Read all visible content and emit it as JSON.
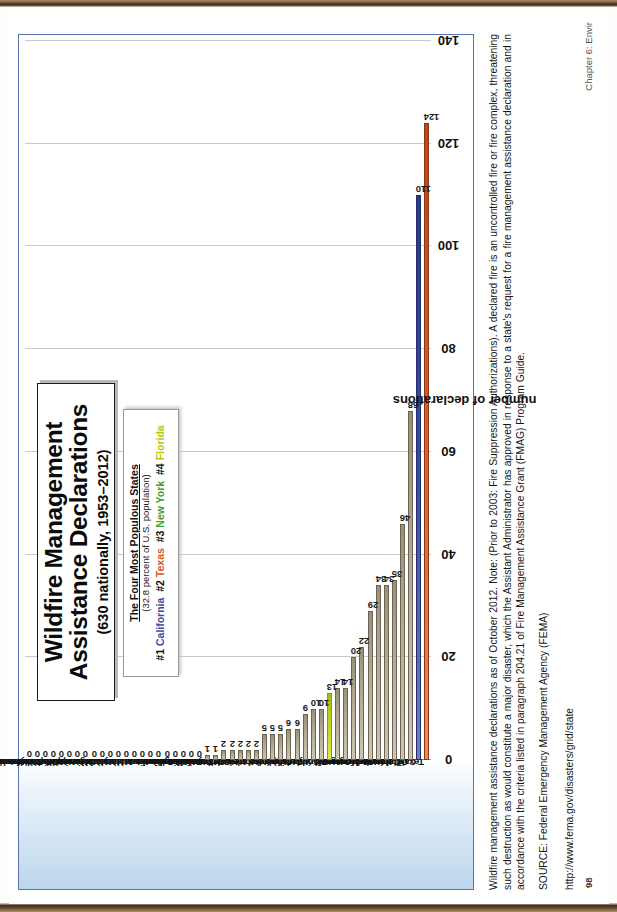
{
  "page": {
    "folio": "98",
    "running_head": "Chapter 6: Envir"
  },
  "title": {
    "line1": "Wildfire Management",
    "line2": "Assistance Declarations",
    "subtitle": "(630 nationally, 1953–2012)"
  },
  "legend": {
    "heading": "The Four Most Populous States",
    "subheading": "(32.8 percent of U.S. population)",
    "items": [
      {
        "rank": "#1",
        "state": "California",
        "color": "#3a4c9e",
        "cls": "lg-ca"
      },
      {
        "rank": "#2",
        "state": "Texas",
        "color": "#d9541f",
        "cls": "lg-tx"
      },
      {
        "rank": "#3",
        "state": "New York",
        "color": "#3aa02e",
        "cls": "lg-ny"
      },
      {
        "rank": "#4",
        "state": "Florida",
        "color": "#b8c40f",
        "cls": "lg-fl"
      }
    ]
  },
  "caption": {
    "note": "Wildfire management assistance declarations as of October 2012. Note: (Prior to 2003: Fire Suppression Authorizations). A declared fire is an uncontrolled fire or fire complex, threatening such destruction as would constitute a major disaster, which the Assistant Administrator has approved in response to a state's request for a fire management assistance declaration and in accordance with the criteria listed in paragraph 204.21 of Fire Management Assistance Grant (FMAG) Program Guide.",
    "source": "SOURCE: Federal Emergency Management Agency (FEMA)",
    "url": "http://www.fema.gov/disasters/grid/state"
  },
  "chart_data": {
    "type": "bar",
    "orientation": "horizontal",
    "title": "Wildfire Management Assistance Declarations (630 nationally, 1953–2012)",
    "xlabel": "",
    "ylabel": "number of declarations",
    "ylim": [
      0,
      140
    ],
    "yticks": [
      0,
      20,
      40,
      60,
      80,
      100,
      120,
      140
    ],
    "grid": true,
    "legend_position": "top-left",
    "highlight_colors": {
      "California": "#3a4c9e",
      "Texas": "#d9541f",
      "New York": "#3aa02e",
      "Florida": "#b8c40f",
      "other": "#b5ab92"
    },
    "categories": [
      "Texas",
      "California",
      "Oklahoma",
      "Colorado",
      "New Mexico",
      "Nevada",
      "Washington",
      "Arizona",
      "Montana",
      "Oregon",
      "Hawaii",
      "Utah",
      "Florida",
      "South Dakota",
      "Wyoming",
      "Georgia",
      "Idaho",
      "Virginia",
      "Alaska",
      "Kentucky",
      "Nebraska",
      "Kansas",
      "New Jersey",
      "North Carolina",
      "South Carolina",
      "Minnesota",
      "Tennessee",
      "West Virginia",
      "Alabama",
      "Arkansas",
      "Connecticut",
      "Delaware",
      "Illinois",
      "Indiana",
      "Iowa",
      "Louisiana",
      "Maine",
      "Maryland",
      "Massachusetts",
      "Michigan",
      "Mississippi",
      "Missouri",
      "New Hampshire",
      "New York",
      "North Dakota",
      "Ohio",
      "Pennsylvania",
      "Rhode Island",
      "Vermont",
      "Wisconsin"
    ],
    "values": [
      124,
      110,
      68,
      46,
      35,
      34,
      34,
      29,
      22,
      20,
      14,
      14,
      13,
      10,
      10,
      9,
      6,
      6,
      5,
      5,
      5,
      2,
      2,
      2,
      2,
      2,
      1,
      1,
      0,
      0,
      0,
      0,
      0,
      0,
      0,
      0,
      0,
      0,
      0,
      0,
      0,
      0,
      0,
      0,
      0,
      0,
      0,
      0,
      0,
      0
    ]
  }
}
